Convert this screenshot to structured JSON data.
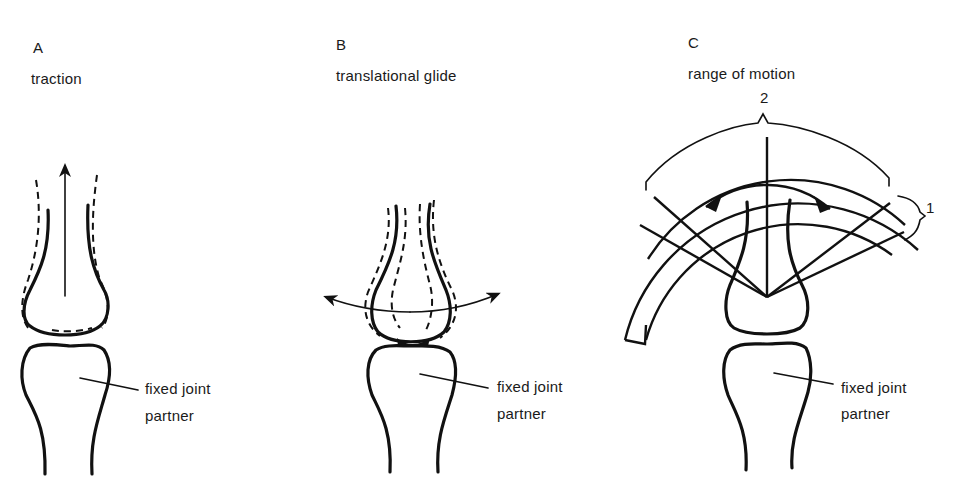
{
  "panels": [
    {
      "letter": "A",
      "title": "traction",
      "pointer_label_line1": "fixed joint",
      "pointer_label_line2": "partner"
    },
    {
      "letter": "B",
      "title": "translational glide",
      "pointer_label_line1": "fixed joint",
      "pointer_label_line2": "partner"
    },
    {
      "letter": "C",
      "title": "range of motion",
      "pointer_label_line1": "fixed joint",
      "pointer_label_line2": "partner",
      "brace_label_outer": "2",
      "brace_label_side": "1"
    }
  ],
  "colors": {
    "ink": "#111111",
    "background": "#ffffff"
  }
}
